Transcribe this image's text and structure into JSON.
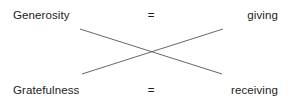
{
  "diagram": {
    "type": "crossed-equivalence",
    "background_color": "#ffffff",
    "text_color": "#1b1b1b",
    "line_color": "#555555",
    "rows": [
      {
        "id": "top",
        "label": "Generosity",
        "operator": "=",
        "value": "giving"
      },
      {
        "id": "bottom",
        "label": "Gratefulness",
        "operator": "=",
        "value": "receiving"
      }
    ],
    "cross": {
      "description": "two straight lines forming an X between the two rows",
      "line_a": {
        "x1": 80,
        "y1": 29,
        "x2": 222,
        "y2": 74
      },
      "line_b": {
        "x1": 82,
        "y1": 74,
        "x2": 223,
        "y2": 29
      },
      "intersection": {
        "x": 151,
        "y": 51
      }
    }
  }
}
